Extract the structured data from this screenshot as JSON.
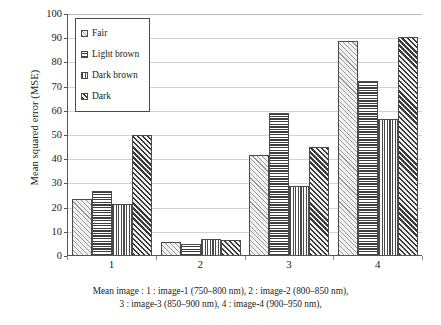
{
  "chart_data": {
    "type": "bar",
    "title": "",
    "subtitle": "",
    "xlabel": "",
    "ylabel": "Mean squared error (MSE)",
    "categories": [
      "1",
      "2",
      "3",
      "4"
    ],
    "series": [
      {
        "name": "Fair",
        "pattern": "diagonal-light-hatch",
        "values": [
          23,
          5.5,
          41.5,
          88.5
        ]
      },
      {
        "name": "Light brown",
        "pattern": "horizontal-lines",
        "values": [
          26.5,
          4.5,
          58.5,
          72
        ]
      },
      {
        "name": "Dark brown",
        "pattern": "vertical-lines",
        "values": [
          21,
          6.5,
          28.5,
          56
        ]
      },
      {
        "name": "Dark",
        "pattern": "diagonal-dark-hatch",
        "values": [
          49.5,
          6,
          44.5,
          90
        ]
      }
    ],
    "ylim": [
      0,
      100
    ],
    "ytick_values": [
      0,
      10,
      20,
      30,
      40,
      50,
      60,
      70,
      80,
      90,
      100
    ],
    "ytick_labels": [
      "0",
      "10",
      "20",
      "30",
      "40",
      "50",
      "60",
      "70",
      "80",
      "90",
      "100"
    ],
    "grid": true,
    "grid_axis": "y",
    "legend_position": "upper-left-inside",
    "colors": {
      "axis": "#555555",
      "gridline": "#d3d3d3",
      "bar_outline": "#4a4a4a",
      "text": "#1a1a1a"
    }
  },
  "legend": {
    "items": [
      {
        "label": "Fair"
      },
      {
        "label": "Light brown"
      },
      {
        "label": "Dark brown"
      },
      {
        "label": "Dark"
      }
    ]
  },
  "caption": {
    "line1": "Mean image : 1 : image-1 (750–800 nm), 2 : image-2 (800–850 nm),",
    "line2": "3 : image-3 (850–900 nm), 4 : image-4 (900–950 nm),"
  }
}
